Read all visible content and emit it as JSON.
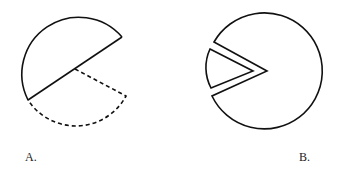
{
  "figures": [
    {
      "id": "A",
      "label": "A.",
      "description": "Circle with a sector rotated out; original position shown dashed"
    },
    {
      "id": "B",
      "label": "B.",
      "description": "Circle with a wedge notch and the separated wedge piece"
    }
  ],
  "colors": {
    "stroke": "#111111",
    "background": "#ffffff"
  }
}
